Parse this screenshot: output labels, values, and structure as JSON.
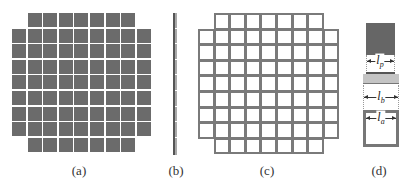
{
  "figure": {
    "panels": [
      {
        "id": "a",
        "label": "(a)",
        "description": "filled square patch array",
        "label_x": 79
      },
      {
        "id": "b",
        "label": "(b)",
        "description": "side view of array",
        "label_x": 176
      },
      {
        "id": "c",
        "label": "(c)",
        "description": "outlined square cell array",
        "label_x": 267
      },
      {
        "id": "d",
        "label": "(d)",
        "description": "unit cell dimensions",
        "label_x": 379
      }
    ],
    "grid": {
      "rows": 9,
      "cols": 9,
      "row_counts": [
        7,
        9,
        9,
        9,
        9,
        9,
        9,
        9,
        7
      ],
      "pitch_px": 15.6,
      "cell_px": 14
    },
    "dimensions": {
      "lp": {
        "symbol": "l",
        "subscript": "p"
      },
      "lb": {
        "symbol": "l",
        "subscript": "b"
      },
      "la": {
        "symbol": "l",
        "subscript": "a"
      }
    },
    "colors": {
      "filled": "#6b6b6b",
      "outline": "#7a7a7a",
      "band": "#c4c4c4"
    }
  }
}
